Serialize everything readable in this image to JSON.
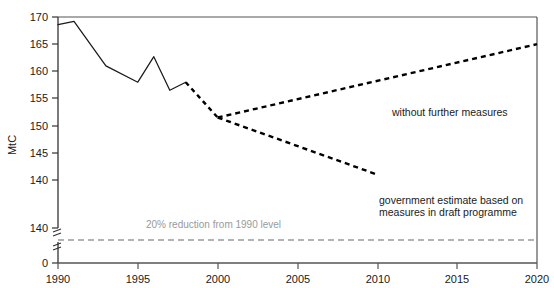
{
  "chart_data": {
    "type": "line",
    "title": "",
    "xlabel": "",
    "ylabel": "MtC",
    "xlim": [
      1990,
      2020
    ],
    "ylim": [
      135,
      170
    ],
    "y_axis_broken": true,
    "y_axis_break_note": "axis broken between 0 and the lowest plotted band",
    "grid": false,
    "legend_position": "inline-annotations",
    "xticks": [
      "1990",
      "1995",
      "2000",
      "2005",
      "2010",
      "2015",
      "2020"
    ],
    "xtick_values": [
      1990,
      1995,
      2000,
      2005,
      2010,
      2015,
      2020
    ],
    "yticks": [
      "170",
      "165",
      "160",
      "155",
      "150",
      "145",
      "140",
      "140",
      "0"
    ],
    "ytick_values": [
      170,
      165,
      160,
      155,
      150,
      145,
      140,
      140,
      0
    ],
    "series": [
      {
        "name": "historical",
        "style": "solid",
        "color": "#1a1a1a",
        "x": [
          1990,
          1991,
          1993,
          1995,
          1996,
          1997,
          1998
        ],
        "values": [
          168.6,
          169.2,
          161.0,
          158.0,
          162.7,
          156.5,
          158.0
        ]
      },
      {
        "name": "transition",
        "style": "dashed",
        "color": "#000000",
        "x": [
          1998,
          2000
        ],
        "values": [
          158.0,
          151.5
        ]
      },
      {
        "name": "without further measures",
        "style": "dashed",
        "color": "#000000",
        "x": [
          2000,
          2020
        ],
        "values": [
          151.5,
          165.0
        ]
      },
      {
        "name": "government estimate based on measures in draft programme",
        "style": "dashed",
        "color": "#000000",
        "x": [
          2000,
          2010
        ],
        "values": [
          151.5,
          141.0
        ]
      },
      {
        "name": "20% reduction from 1990 level",
        "style": "dashed",
        "color": "#9a9a9a",
        "x": [
          1990,
          2020
        ],
        "values": [
          138.5,
          138.5
        ]
      }
    ],
    "annotations": [
      {
        "id": "without-further-measures",
        "text": "without further measures",
        "color": "#1a1a1a"
      },
      {
        "id": "government-estimate",
        "line1": "government estimate based on",
        "line2": "measures in draft programme",
        "color": "#1a1a1a"
      },
      {
        "id": "reduction-target",
        "text": "20% reduction from 1990 level",
        "color": "#9a9a9a"
      }
    ]
  },
  "axis": {
    "y_title": "MtC",
    "ticks_y": {
      "t170": "170",
      "t165": "165",
      "t160": "160",
      "t155": "155",
      "t150": "150",
      "t145": "145",
      "t140a": "140",
      "t140b": "140",
      "t0": "0"
    },
    "ticks_x": {
      "x1990": "1990",
      "x1995": "1995",
      "x2000": "2000",
      "x2005": "2005",
      "x2010": "2010",
      "x2015": "2015",
      "x2020": "2020"
    }
  },
  "annotations": {
    "without_measures": "without further measures",
    "gov_estimate_line1": "government estimate based on",
    "gov_estimate_line2": "measures in draft programme",
    "reduction_target": "20% reduction from 1990 level"
  },
  "colors": {
    "line": "#1a1a1a",
    "axis": "#555555",
    "grey_annotation": "#9a9a9a",
    "background": "#ffffff"
  }
}
